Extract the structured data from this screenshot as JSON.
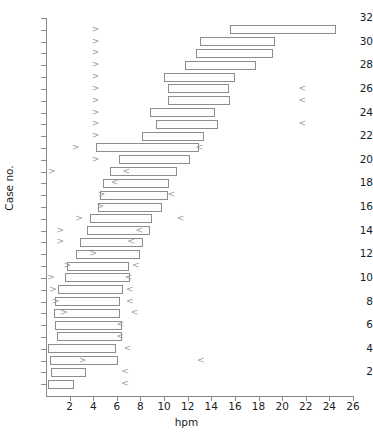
{
  "chart_data": {
    "type": "bar",
    "orientation": "horizontal",
    "title": "",
    "xlabel": "hpm",
    "ylabel": "Case no.",
    "xlim": [
      0,
      26
    ],
    "ylim": [
      0,
      32
    ],
    "grid": false,
    "legend": null,
    "x_ticks": [
      2,
      4,
      6,
      8,
      10,
      12,
      14,
      16,
      18,
      20,
      22,
      24,
      26
    ],
    "y_ticks": [
      2,
      4,
      6,
      8,
      10,
      12,
      14,
      16,
      18,
      20,
      22,
      24,
      26,
      28,
      30,
      32
    ],
    "categories": [
      1,
      2,
      3,
      4,
      5,
      6,
      7,
      8,
      9,
      10,
      11,
      12,
      13,
      14,
      15,
      16,
      17,
      18,
      19,
      20,
      21,
      22,
      23,
      24,
      25,
      26,
      27,
      28,
      29,
      30,
      31
    ],
    "intervals": [
      {
        "case": 1,
        "start": 0.2,
        "end": 2.4
      },
      {
        "case": 2,
        "start": 0.4,
        "end": 3.4
      },
      {
        "case": 3,
        "start": 0.3,
        "end": 6.1
      },
      {
        "case": 4,
        "start": 0.2,
        "end": 5.9
      },
      {
        "case": 5,
        "start": 0.9,
        "end": 6.4
      },
      {
        "case": 6,
        "start": 0.8,
        "end": 6.4
      },
      {
        "case": 7,
        "start": 0.7,
        "end": 6.3
      },
      {
        "case": 8,
        "start": 0.8,
        "end": 6.3
      },
      {
        "case": 9,
        "start": 1.0,
        "end": 6.5
      },
      {
        "case": 10,
        "start": 1.6,
        "end": 7.1
      },
      {
        "case": 11,
        "start": 1.8,
        "end": 7.0
      },
      {
        "case": 12,
        "start": 2.5,
        "end": 8.0
      },
      {
        "case": 13,
        "start": 2.9,
        "end": 8.2
      },
      {
        "case": 14,
        "start": 3.5,
        "end": 8.8
      },
      {
        "case": 15,
        "start": 3.7,
        "end": 9.0
      },
      {
        "case": 16,
        "start": 4.4,
        "end": 9.8
      },
      {
        "case": 17,
        "start": 4.6,
        "end": 10.3
      },
      {
        "case": 18,
        "start": 4.8,
        "end": 10.4
      },
      {
        "case": 19,
        "start": 5.4,
        "end": 11.1
      },
      {
        "case": 20,
        "start": 6.2,
        "end": 12.2
      },
      {
        "case": 21,
        "start": 4.2,
        "end": 13.0
      },
      {
        "case": 22,
        "start": 8.1,
        "end": 13.4
      },
      {
        "case": 23,
        "start": 9.3,
        "end": 14.6
      },
      {
        "case": 24,
        "start": 8.8,
        "end": 14.3
      },
      {
        "case": 25,
        "start": 10.3,
        "end": 15.6
      },
      {
        "case": 26,
        "start": 10.3,
        "end": 15.5
      },
      {
        "case": 27,
        "start": 10.0,
        "end": 16.0
      },
      {
        "case": 28,
        "start": 11.8,
        "end": 17.8
      },
      {
        "case": 29,
        "start": 12.7,
        "end": 19.2
      },
      {
        "case": 30,
        "start": 13.0,
        "end": 19.4
      },
      {
        "case": 31,
        "start": 15.6,
        "end": 24.6
      }
    ],
    "markers": [
      {
        "case": 1,
        "x": 6.7,
        "symbol": "<"
      },
      {
        "case": 2,
        "x": 6.7,
        "symbol": "<"
      },
      {
        "case": 3,
        "x": 3.1,
        "symbol": ">"
      },
      {
        "case": 3,
        "x": 13.1,
        "symbol": "<"
      },
      {
        "case": 4,
        "x": 6.9,
        "symbol": "<"
      },
      {
        "case": 5,
        "x": 6.3,
        "symbol": "<"
      },
      {
        "case": 6,
        "x": 6.3,
        "symbol": "<"
      },
      {
        "case": 7,
        "x": 1.5,
        "symbol": ">"
      },
      {
        "case": 7,
        "x": 7.5,
        "symbol": "<"
      },
      {
        "case": 8,
        "x": 0.8,
        "symbol": ">"
      },
      {
        "case": 8,
        "x": 7.1,
        "symbol": "<"
      },
      {
        "case": 9,
        "x": 0.6,
        "symbol": ">"
      },
      {
        "case": 9,
        "x": 7.1,
        "symbol": "<"
      },
      {
        "case": 10,
        "x": 0.4,
        "symbol": ">"
      },
      {
        "case": 10,
        "x": 7.0,
        "symbol": "<"
      },
      {
        "case": 11,
        "x": 1.8,
        "symbol": ">"
      },
      {
        "case": 11,
        "x": 7.6,
        "symbol": "<"
      },
      {
        "case": 12,
        "x": 4.0,
        "symbol": ">"
      },
      {
        "case": 13,
        "x": 1.2,
        "symbol": ">"
      },
      {
        "case": 13,
        "x": 7.2,
        "symbol": "<"
      },
      {
        "case": 14,
        "x": 1.2,
        "symbol": ">"
      },
      {
        "case": 14,
        "x": 7.9,
        "symbol": "<"
      },
      {
        "case": 15,
        "x": 2.8,
        "symbol": ">"
      },
      {
        "case": 15,
        "x": 11.4,
        "symbol": "<"
      },
      {
        "case": 16,
        "x": 4.6,
        "symbol": ">"
      },
      {
        "case": 17,
        "x": 4.7,
        "symbol": ">"
      },
      {
        "case": 17,
        "x": 10.6,
        "symbol": "<"
      },
      {
        "case": 18,
        "x": 5.8,
        "symbol": "<"
      },
      {
        "case": 19,
        "x": 0.5,
        "symbol": ">"
      },
      {
        "case": 19,
        "x": 6.8,
        "symbol": "<"
      },
      {
        "case": 20,
        "x": 4.2,
        "symbol": ">"
      },
      {
        "case": 21,
        "x": 2.5,
        "symbol": ">"
      },
      {
        "case": 21,
        "x": 13.0,
        "symbol": "<"
      },
      {
        "case": 22,
        "x": 4.2,
        "symbol": ">"
      },
      {
        "case": 23,
        "x": 4.2,
        "symbol": ">"
      },
      {
        "case": 23,
        "x": 21.7,
        "symbol": "<"
      },
      {
        "case": 24,
        "x": 4.2,
        "symbol": ">"
      },
      {
        "case": 25,
        "x": 4.2,
        "symbol": ">"
      },
      {
        "case": 25,
        "x": 21.7,
        "symbol": "<"
      },
      {
        "case": 26,
        "x": 4.2,
        "symbol": ">"
      },
      {
        "case": 26,
        "x": 21.7,
        "symbol": "<"
      },
      {
        "case": 27,
        "x": 4.2,
        "symbol": ">"
      },
      {
        "case": 28,
        "x": 4.2,
        "symbol": ">"
      },
      {
        "case": 29,
        "x": 4.2,
        "symbol": ">"
      },
      {
        "case": 30,
        "x": 4.2,
        "symbol": ">"
      },
      {
        "case": 31,
        "x": 4.2,
        "symbol": ">"
      }
    ],
    "colors": {
      "bar_fill": "#fdfdfd",
      "bar_stroke": "#8d8d8d",
      "axis": "#8a8a8a",
      "marker": "#9a9a9a",
      "text": "#1c1c1c",
      "background": "#ffffff"
    }
  }
}
